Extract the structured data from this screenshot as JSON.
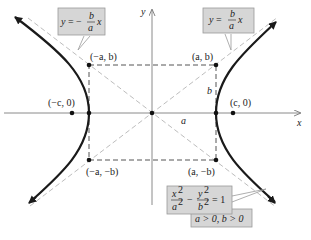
{
  "figure": {
    "type": "hyperbola-diagram",
    "axes": {
      "x_label": "x",
      "y_label": "y"
    },
    "points": {
      "a_b": "(a, b)",
      "neg_a_b": "(−a, b)",
      "neg_a_neg_b": "(−a, −b)",
      "a_neg_b": "(a, −b)",
      "c_0": "(c, 0)",
      "neg_c_0": "(−c, 0)"
    },
    "segment_labels": {
      "a": "a",
      "b": "b"
    },
    "asymptotes": {
      "left": {
        "lhs": "y = −",
        "num": "b",
        "den": "a",
        "var": "x"
      },
      "right": {
        "lhs": "y = ",
        "num": "b",
        "den": "a",
        "var": "x"
      }
    },
    "equation": {
      "x_term_num": "x",
      "x_term_den": "a",
      "minus": "−",
      "y_term_num": "y",
      "y_term_den": "b",
      "exp": "2",
      "rhs": "= 1",
      "condition": "a > 0, b > 0"
    },
    "colors": {
      "curve": "#1a1a1a",
      "axis": "#8a8a8a",
      "asymptote": "#b8b8b8",
      "rectangle": "#555555",
      "label_box": "#d6d6d6"
    }
  }
}
